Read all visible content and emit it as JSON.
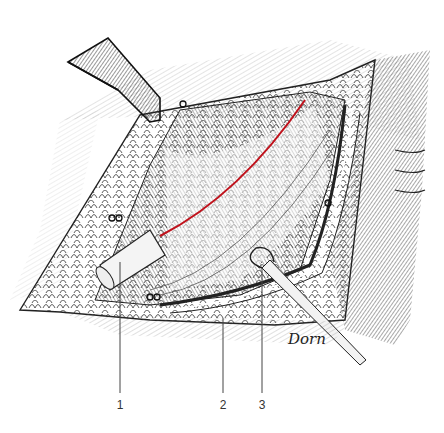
{
  "figure": {
    "type": "surgical line illustration",
    "signature": "Dorn",
    "incision_color": "#c0121c",
    "ink_color": "#222222",
    "labels": [
      {
        "text": "1",
        "x": 120,
        "line_top": 262,
        "line_bottom": 393
      },
      {
        "text": "2",
        "x": 223,
        "line_top": 318,
        "line_bottom": 393
      },
      {
        "text": "3",
        "x": 262,
        "line_top": 268,
        "line_bottom": 393
      }
    ]
  }
}
